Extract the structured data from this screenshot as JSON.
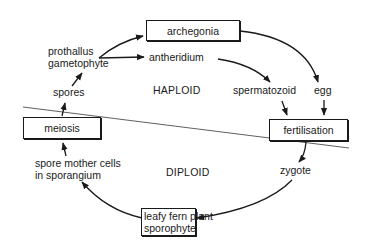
{
  "diagram": {
    "regions": {
      "upper": "HAPLOID",
      "lower": "DIPLOID"
    },
    "boxes": {
      "archegonia": "archegonia",
      "meiosis": "meiosis",
      "fertilisation": "fertilisation",
      "sporophyte_line1": "leafy fern plant",
      "sporophyte_line2": "sporophyte"
    },
    "labels": {
      "prothallus": "prothallus",
      "gametophyte": "gametophyte",
      "antheridium": "antheridium",
      "spores": "spores",
      "spermatozoid": "spermatozoid",
      "egg": "egg",
      "spore_mother_line1": "spore mother cells",
      "spore_mother_line2": "in sporangium",
      "zygote": "zygote"
    },
    "flow": [
      "prothallus gametophyte -> archegonia",
      "prothallus gametophyte -> antheridium",
      "antheridium -> spermatozoid",
      "archegonia -> egg",
      "spermatozoid -> fertilisation",
      "egg -> fertilisation",
      "fertilisation -> zygote",
      "zygote -> leafy fern plant sporophyte",
      "leafy fern plant sporophyte -> spore mother cells in sporangium",
      "spore mother cells in sporangium -> meiosis",
      "meiosis -> spores",
      "spores -> prothallus gametophyte"
    ],
    "colors": {
      "ink": "#1a1a1a",
      "background": "#ffffff"
    }
  }
}
